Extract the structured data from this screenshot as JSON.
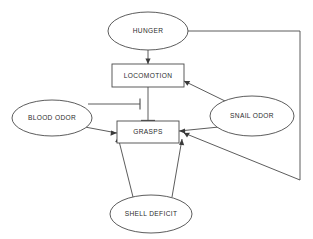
{
  "diagram": {
    "type": "behavior-network-graph",
    "background_color": "#ffffff",
    "stroke_color": "#4a4a4a",
    "text_color": "#2b2b2b",
    "nodes": [
      {
        "id": "hunger",
        "label": "HUNGER",
        "shape": "ellipse",
        "cx": 148,
        "cy": 31,
        "rx": 40,
        "ry": 19
      },
      {
        "id": "locomotion",
        "label": "LOCOMOTION",
        "shape": "rectangle",
        "x": 112,
        "y": 64,
        "w": 72,
        "h": 23
      },
      {
        "id": "blood_odor",
        "label": "BLOOD ODOR",
        "shape": "ellipse",
        "cx": 52,
        "cy": 118,
        "rx": 40,
        "ry": 18
      },
      {
        "id": "grasps",
        "label": "GRASPS",
        "shape": "rectangle",
        "x": 117,
        "y": 121,
        "w": 62,
        "h": 22
      },
      {
        "id": "snail_odor",
        "label": "SNAIL ODOR",
        "shape": "ellipse",
        "cx": 252,
        "cy": 116,
        "rx": 42,
        "ry": 20
      },
      {
        "id": "shell_deficit",
        "label": "SHELL DEFICIT",
        "shape": "ellipse",
        "cx": 151,
        "cy": 214,
        "rx": 41,
        "ry": 19
      }
    ],
    "edges": [
      {
        "id": "hunger-to-locomotion",
        "from": "hunger",
        "to": "locomotion",
        "kind": "excitatory"
      },
      {
        "id": "hunger-to-grasps",
        "from": "hunger",
        "to": "grasps",
        "kind": "excitatory"
      },
      {
        "id": "snail-odor-to-locomotion",
        "from": "snail_odor",
        "to": "locomotion",
        "kind": "excitatory"
      },
      {
        "id": "snail-odor-to-grasps",
        "from": "snail_odor",
        "to": "grasps",
        "kind": "excitatory"
      },
      {
        "id": "blood-odor-to-grasps",
        "from": "blood_odor",
        "to": "grasps",
        "kind": "excitatory"
      },
      {
        "id": "blood-odor-to-locomotion",
        "from": "blood_odor",
        "to": "locomotion",
        "kind": "inhibitory"
      },
      {
        "id": "locomotion-to-grasps",
        "from": "locomotion",
        "to": "grasps",
        "kind": "inhibitory"
      },
      {
        "id": "shell-deficit-to-grasps-l",
        "from": "shell_deficit",
        "to": "grasps",
        "kind": "excitatory"
      },
      {
        "id": "shell-deficit-to-grasps-r",
        "from": "shell_deficit",
        "to": "grasps",
        "kind": "excitatory"
      }
    ]
  }
}
